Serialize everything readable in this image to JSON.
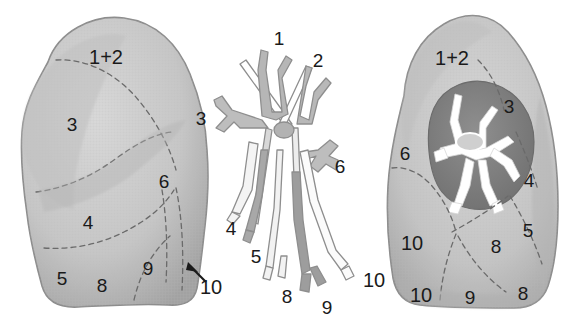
{
  "figure": {
    "background_color": "#ffffff",
    "label_color": "#1a1a1a",
    "lung_fill": "#c9c9c9",
    "lung_edge": "#9a9a9a",
    "hilum_fill": "#8a8a8a",
    "bronchus_fill": "#ffffff",
    "tree_stroke": "#8e8e8e",
    "dash_color": "#6e6e6e"
  },
  "panels": [
    {
      "name": "left-lung-lateral",
      "caption": "Left lung, lateral view",
      "labels": [
        {
          "text": "1+2",
          "x": 106,
          "y": 57
        },
        {
          "text": "3",
          "x": 72,
          "y": 124
        },
        {
          "text": "4",
          "x": 88,
          "y": 222
        },
        {
          "text": "5",
          "x": 62,
          "y": 278
        },
        {
          "text": "6",
          "x": 164,
          "y": 181
        },
        {
          "text": "8",
          "x": 102,
          "y": 285
        },
        {
          "text": "9",
          "x": 148,
          "y": 268
        },
        {
          "text": "10",
          "x": 211,
          "y": 287
        }
      ],
      "arrow": {
        "from_x": 192,
        "from_y": 268,
        "to_x": 205,
        "to_y": 281
      }
    },
    {
      "name": "bronchial-tree",
      "caption": "Bronchial tree, segmental bronchi",
      "labels": [
        {
          "text": "1",
          "x": 279,
          "y": 38
        },
        {
          "text": "2",
          "x": 318,
          "y": 60
        },
        {
          "text": "3",
          "x": 201,
          "y": 118
        },
        {
          "text": "4",
          "x": 231,
          "y": 228
        },
        {
          "text": "5",
          "x": 256,
          "y": 256
        },
        {
          "text": "6",
          "x": 340,
          "y": 166
        },
        {
          "text": "8",
          "x": 287,
          "y": 296
        },
        {
          "text": "9",
          "x": 327,
          "y": 307
        },
        {
          "text": "10",
          "x": 374,
          "y": 280
        }
      ]
    },
    {
      "name": "right-lung-medial",
      "caption": "Right lung, medial view with hilum",
      "labels": [
        {
          "text": "1+2",
          "x": 452,
          "y": 58
        },
        {
          "text": "3",
          "x": 509,
          "y": 106
        },
        {
          "text": "4",
          "x": 529,
          "y": 180
        },
        {
          "text": "5",
          "x": 528,
          "y": 230
        },
        {
          "text": "6",
          "x": 405,
          "y": 153
        },
        {
          "text": "8",
          "x": 496,
          "y": 246
        },
        {
          "text": "10",
          "x": 412,
          "y": 243
        },
        {
          "text": "10",
          "x": 421,
          "y": 295
        },
        {
          "text": "9",
          "x": 470,
          "y": 297
        },
        {
          "text": "8",
          "x": 523,
          "y": 293
        }
      ]
    }
  ]
}
